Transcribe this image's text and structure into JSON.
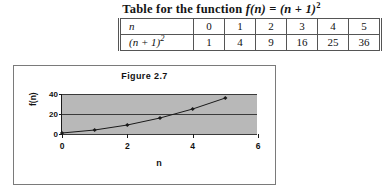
{
  "table_block": {
    "caption_prefix": "Table for the function",
    "caption_formula_f": "f",
    "caption_formula_arg": "(n)",
    "caption_formula_eq": "=",
    "caption_formula_rhs": "(n + 1)",
    "caption_formula_exp": "2",
    "row_labels": [
      "n",
      "(n + 1)"
    ],
    "row_label_exponent": "2",
    "n_values": [
      "0",
      "1",
      "2",
      "3",
      "4",
      "5"
    ],
    "f_values": [
      "1",
      "4",
      "9",
      "16",
      "25",
      "36"
    ]
  },
  "chart_data": {
    "type": "line",
    "title": "Figure 2.7",
    "xlabel": "n",
    "ylabel": "f(n)",
    "x": [
      0,
      1,
      2,
      3,
      4,
      5
    ],
    "values": [
      1,
      4,
      9,
      16,
      25,
      36
    ],
    "series": [
      {
        "name": "f(n)",
        "values": [
          1,
          4,
          9,
          16,
          25,
          36
        ]
      }
    ],
    "xlim": [
      0,
      6
    ],
    "ylim": [
      0,
      40
    ],
    "xticks": [
      "0",
      "2",
      "4",
      "6"
    ],
    "xtick_values": [
      0,
      2,
      4,
      6
    ],
    "yticks": [
      "0",
      "20",
      "40"
    ],
    "ytick_values": [
      0,
      20,
      40
    ],
    "grid": true,
    "legend": "none",
    "marker": "diamond",
    "plot_background_color": "#b8b8b8",
    "line_color": "#1a1a1a",
    "chart_background_color": "#ffffff"
  }
}
